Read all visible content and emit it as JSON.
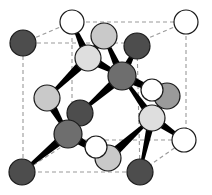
{
  "figure": {
    "background_color": "#ffffff",
    "width": 212,
    "height": 195
  },
  "palette": {
    "cell_edge": "#9a9a9a",
    "atom_outline": "#1a1a1a",
    "bond": "#000000",
    "dark_atom": "#4d4d4d",
    "mid_atom": "#6e6e6e",
    "light_atom": "#c9c9c9",
    "pale_atom": "#dedede",
    "open_atom": "#ffffff"
  },
  "cell": {
    "style": "dashed",
    "dash_pattern": "4 3",
    "stroke_width": 1.1,
    "vertices": {
      "front_top_left": [
        72,
        22
      ],
      "front_top_right": [
        186,
        22
      ],
      "front_bottom_left": [
        72,
        140
      ],
      "front_bottom_right": [
        186,
        140
      ],
      "back_top_left": [
        23,
        43
      ],
      "back_top_right": [
        137,
        43
      ],
      "back_bottom_left": [
        23,
        172
      ],
      "back_bottom_right": [
        140,
        172
      ]
    },
    "edges": [
      [
        "front_top_left",
        "front_top_right"
      ],
      [
        "front_top_right",
        "front_bottom_right"
      ],
      [
        "front_bottom_right",
        "front_bottom_left"
      ],
      [
        "front_bottom_left",
        "front_top_left"
      ],
      [
        "back_top_left",
        "back_top_right"
      ],
      [
        "back_top_right",
        "back_bottom_right"
      ],
      [
        "back_bottom_right",
        "back_bottom_left"
      ],
      [
        "back_bottom_left",
        "back_top_left"
      ],
      [
        "front_top_left",
        "back_top_left"
      ],
      [
        "front_top_right",
        "back_top_right"
      ],
      [
        "front_bottom_left",
        "back_bottom_left"
      ],
      [
        "front_bottom_right",
        "back_bottom_right"
      ]
    ]
  },
  "atoms": [
    {
      "id": "corner-back-top-left",
      "x": 23,
      "y": 43,
      "r": 13,
      "fill": "#4d4d4d",
      "kind": "dark"
    },
    {
      "id": "corner-back-bottom-left",
      "x": 22,
      "y": 172,
      "r": 13,
      "fill": "#4d4d4d",
      "kind": "dark"
    },
    {
      "id": "corner-back-bottom-right",
      "x": 140,
      "y": 172,
      "r": 13,
      "fill": "#4d4d4d",
      "kind": "dark"
    },
    {
      "id": "corner-back-top-right",
      "x": 137,
      "y": 46,
      "r": 13,
      "fill": "#4d4d4d",
      "kind": "dark"
    },
    {
      "id": "corner-front-top-left",
      "x": 72,
      "y": 22,
      "r": 12,
      "fill": "#ffffff",
      "kind": "open"
    },
    {
      "id": "corner-front-top-right",
      "x": 186,
      "y": 22,
      "r": 12,
      "fill": "#ffffff",
      "kind": "open"
    },
    {
      "id": "corner-front-bottom-right",
      "x": 184,
      "y": 140,
      "r": 12,
      "fill": "#ffffff",
      "kind": "open"
    },
    {
      "id": "face-center-upper",
      "x": 104,
      "y": 36,
      "r": 13,
      "fill": "#c9c9c9",
      "kind": "light"
    },
    {
      "id": "face-center-left-upper",
      "x": 88,
      "y": 58,
      "r": 13,
      "fill": "#dedede",
      "kind": "pale"
    },
    {
      "id": "interior-center",
      "x": 122,
      "y": 76,
      "r": 14,
      "fill": "#6e6e6e",
      "kind": "mid"
    },
    {
      "id": "face-center-left",
      "x": 47,
      "y": 98,
      "r": 13,
      "fill": "#c9c9c9",
      "kind": "light"
    },
    {
      "id": "face-center-right-upper",
      "x": 167,
      "y": 96,
      "r": 13,
      "fill": "#9a9a9a",
      "kind": "mid"
    },
    {
      "id": "interior-lower-left",
      "x": 80,
      "y": 113,
      "r": 13,
      "fill": "#4d4d4d",
      "kind": "dark"
    },
    {
      "id": "face-center-right-lower",
      "x": 152,
      "y": 118,
      "r": 13,
      "fill": "#dedede",
      "kind": "pale"
    },
    {
      "id": "interior-bottom-left",
      "x": 68,
      "y": 134,
      "r": 14,
      "fill": "#6e6e6e",
      "kind": "mid"
    },
    {
      "id": "face-center-bottom",
      "x": 108,
      "y": 158,
      "r": 13,
      "fill": "#c9c9c9",
      "kind": "light"
    },
    {
      "id": "hidden-front-center",
      "x": 152,
      "y": 90,
      "r": 11,
      "fill": "#ffffff",
      "kind": "open"
    },
    {
      "id": "hidden-bottom-center",
      "x": 96,
      "y": 147,
      "r": 11,
      "fill": "#ffffff",
      "kind": "open"
    }
  ],
  "bonds": [
    {
      "from": "face-center-left-upper",
      "to": "corner-front-top-left",
      "width": 9
    },
    {
      "from": "face-center-left-upper",
      "to": "face-center-upper",
      "width": 9
    },
    {
      "from": "face-center-left-upper",
      "to": "interior-center",
      "width": 10
    },
    {
      "from": "face-center-left-upper",
      "to": "face-center-left",
      "width": 10
    },
    {
      "from": "interior-center",
      "to": "face-center-upper",
      "width": 9
    },
    {
      "from": "interior-center",
      "to": "corner-back-top-right",
      "width": 9
    },
    {
      "from": "interior-center",
      "to": "face-center-right-upper",
      "width": 10
    },
    {
      "from": "interior-center",
      "to": "interior-lower-left",
      "width": 10
    },
    {
      "from": "face-center-left",
      "to": "interior-bottom-left",
      "width": 10
    },
    {
      "from": "interior-lower-left",
      "to": "interior-bottom-left",
      "width": 9
    },
    {
      "from": "interior-bottom-left",
      "to": "corner-back-bottom-left",
      "width": 10
    },
    {
      "from": "interior-bottom-left",
      "to": "face-center-bottom",
      "width": 10
    },
    {
      "from": "face-center-bottom",
      "to": "face-center-right-lower",
      "width": 10
    },
    {
      "from": "face-center-right-lower",
      "to": "face-center-right-upper",
      "width": 9
    },
    {
      "from": "face-center-right-lower",
      "to": "corner-front-bottom-right",
      "width": 9
    },
    {
      "from": "face-center-right-lower",
      "to": "corner-back-bottom-right",
      "width": 8
    },
    {
      "from": "face-center-right-lower",
      "to": "interior-center",
      "width": 8
    }
  ]
}
